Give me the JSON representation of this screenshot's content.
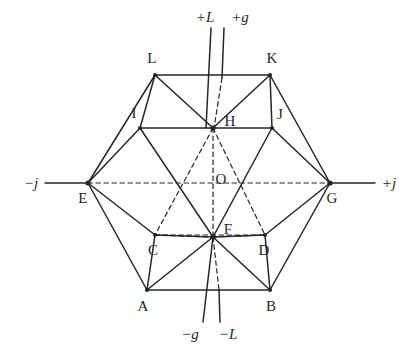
{
  "figure": {
    "background_color": "#ffffff",
    "line_color": "#262626",
    "text_color": "#262626"
  },
  "axes": [
    {
      "id": "axis-neg-j",
      "label": "−j",
      "position": "left",
      "x": 31,
      "y": 183
    },
    {
      "id": "axis-pos-j",
      "label": "+j",
      "position": "right",
      "x": 389,
      "y": 183
    },
    {
      "id": "axis-pos-L",
      "label": "+L",
      "position": "top",
      "x": 205,
      "y": 17
    },
    {
      "id": "axis-pos-g",
      "label": "+g",
      "position": "top",
      "x": 240,
      "y": 17
    },
    {
      "id": "axis-neg-g",
      "label": "−g",
      "position": "bottom",
      "x": 190,
      "y": 334
    },
    {
      "id": "axis-neg-L",
      "label": "−L",
      "position": "bottom",
      "x": 228,
      "y": 334
    }
  ],
  "vertices": [
    {
      "id": "A",
      "label": "A",
      "x": 147,
      "y": 290,
      "label_x": 143,
      "label_y": 306
    },
    {
      "id": "B",
      "label": "B",
      "x": 270,
      "y": 290,
      "label_x": 271,
      "label_y": 306
    },
    {
      "id": "C",
      "label": "C",
      "x": 155,
      "y": 235,
      "label_x": 153,
      "label_y": 250
    },
    {
      "id": "D",
      "label": "D",
      "x": 265,
      "y": 235,
      "label_x": 264,
      "label_y": 250
    },
    {
      "id": "E",
      "label": "E",
      "x": 88,
      "y": 183,
      "label_x": 83,
      "label_y": 198
    },
    {
      "id": "F",
      "label": "F",
      "x": 213,
      "y": 237,
      "label_x": 228,
      "label_y": 229
    },
    {
      "id": "G",
      "label": "G",
      "x": 330,
      "y": 183,
      "label_x": 332,
      "label_y": 198
    },
    {
      "id": "H",
      "label": "H",
      "x": 213,
      "y": 128,
      "label_x": 230,
      "label_y": 121
    },
    {
      "id": "I",
      "label": "I",
      "x": 140,
      "y": 128,
      "label_x": 134,
      "label_y": 113
    },
    {
      "id": "J",
      "label": "J",
      "x": 272,
      "y": 128,
      "label_x": 280,
      "label_y": 114
    },
    {
      "id": "K",
      "label": "K",
      "x": 270,
      "y": 75,
      "label_x": 272,
      "label_y": 58
    },
    {
      "id": "L",
      "label": "L",
      "x": 155,
      "y": 75,
      "label_x": 152,
      "label_y": 58
    },
    {
      "id": "O",
      "label": "O",
      "x": 213,
      "y": 183,
      "label_x": 221,
      "label_y": 179
    }
  ],
  "solid_edges": [
    [
      "L",
      "K"
    ],
    [
      "L",
      "I"
    ],
    [
      "L",
      "E"
    ],
    [
      "L",
      "H"
    ],
    [
      "K",
      "J"
    ],
    [
      "K",
      "G"
    ],
    [
      "K",
      "H"
    ],
    [
      "I",
      "H"
    ],
    [
      "I",
      "E"
    ],
    [
      "I",
      "F"
    ],
    [
      "J",
      "H"
    ],
    [
      "J",
      "G"
    ],
    [
      "J",
      "F"
    ],
    [
      "E",
      "A"
    ],
    [
      "E",
      "C"
    ],
    [
      "G",
      "B"
    ],
    [
      "G",
      "D"
    ],
    [
      "A",
      "B"
    ],
    [
      "A",
      "C"
    ],
    [
      "A",
      "F"
    ],
    [
      "B",
      "D"
    ],
    [
      "B",
      "F"
    ],
    [
      "C",
      "F"
    ],
    [
      "D",
      "F"
    ]
  ],
  "dashed_edges": [
    [
      "E",
      "G"
    ],
    [
      "H",
      "F"
    ],
    [
      "H",
      "C"
    ],
    [
      "H",
      "D"
    ],
    [
      "C",
      "D"
    ],
    [
      "C",
      "F"
    ],
    [
      "D",
      "F"
    ]
  ],
  "axis_lines": [
    {
      "id": "line-pos-L",
      "style": "solid",
      "x1": 211,
      "y1": 28,
      "x2": 206,
      "y2": 128
    },
    {
      "id": "line-pos-g",
      "style": "solid",
      "x1": 224,
      "y1": 28,
      "x2": 222,
      "y2": 78
    },
    {
      "id": "line-pos-g-hidden",
      "style": "dashed",
      "x1": 222,
      "y1": 78,
      "x2": 214,
      "y2": 128
    },
    {
      "id": "line-neg-g",
      "style": "solid",
      "x1": 213,
      "y1": 237,
      "x2": 203,
      "y2": 322
    },
    {
      "id": "line-neg-L-hidden",
      "style": "dashed",
      "x1": 213,
      "y1": 237,
      "x2": 219,
      "y2": 290
    },
    {
      "id": "line-neg-L",
      "style": "solid",
      "x1": 219,
      "y1": 290,
      "x2": 220,
      "y2": 322
    },
    {
      "id": "line-neg-j",
      "style": "solid",
      "x1": 45,
      "y1": 183,
      "x2": 88,
      "y2": 183
    },
    {
      "id": "line-pos-j",
      "style": "solid",
      "x1": 330,
      "y1": 183,
      "x2": 375,
      "y2": 183
    }
  ],
  "vertex_dots": [
    "A",
    "B",
    "E",
    "F",
    "G",
    "H",
    "I",
    "J",
    "K",
    "L",
    "C",
    "D"
  ]
}
